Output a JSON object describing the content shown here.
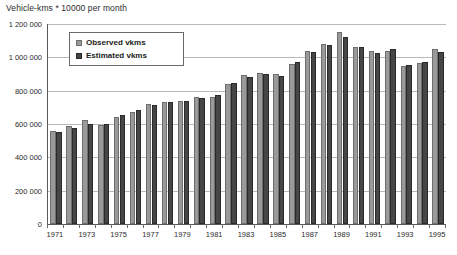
{
  "chart_data": {
    "type": "bar",
    "title": "Vehicle-kms * 10000 per month",
    "xlabel": "",
    "ylabel": "",
    "ylim": [
      0,
      1200000
    ],
    "grid": true,
    "legend_position": "top-left-inside",
    "categories": [
      "1971",
      "1972",
      "1973",
      "1974",
      "1975",
      "1976",
      "1977",
      "1978",
      "1979",
      "1980",
      "1981",
      "1982",
      "1983",
      "1984",
      "1985",
      "1986",
      "1987",
      "1988",
      "1989",
      "1990",
      "1991",
      "1992",
      "1993",
      "1994",
      "1995"
    ],
    "xtick_labels": [
      "1971",
      "1973",
      "1975",
      "1977",
      "1979",
      "1981",
      "1983",
      "1985",
      "1987",
      "1989",
      "1991",
      "1993",
      "1995"
    ],
    "ytick_labels": [
      "0",
      "200 000",
      "400 000",
      "600 000",
      "800 000",
      "1 000 000",
      "1 200 000"
    ],
    "ytick_values": [
      0,
      200000,
      400000,
      600000,
      800000,
      1000000,
      1200000
    ],
    "series": [
      {
        "name": "Observed vkms",
        "color": "#9a9a9a",
        "values": [
          560000,
          590000,
          625000,
          595000,
          645000,
          670000,
          720000,
          735000,
          740000,
          760000,
          765000,
          840000,
          895000,
          905000,
          900000,
          960000,
          1040000,
          1080000,
          1150000,
          1060000,
          1040000,
          1040000,
          950000,
          965000,
          1050000
        ]
      },
      {
        "name": "Estimated vkms",
        "color": "#464646",
        "values": [
          555000,
          578000,
          598000,
          603000,
          655000,
          683000,
          712000,
          732000,
          737000,
          758000,
          772000,
          848000,
          880000,
          900000,
          890000,
          975000,
          1030000,
          1075000,
          1120000,
          1065000,
          1025000,
          1050000,
          955000,
          975000,
          1035000
        ]
      }
    ]
  },
  "legend": {
    "entries": [
      {
        "label": "Observed vkms",
        "icon": "legend-swatch-light"
      },
      {
        "label": "Estimated vkms",
        "icon": "legend-swatch-dark"
      }
    ]
  }
}
